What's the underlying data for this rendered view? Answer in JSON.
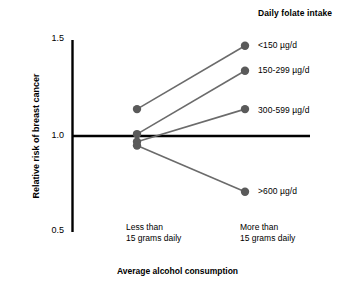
{
  "chart_data": {
    "type": "line",
    "title": "Daily folate intake",
    "xlabel": "Average alcohol consumption",
    "ylabel": "Relative risk of breast cancer",
    "x": [
      "Less than 15 grams daily",
      "More than 15 grams daily"
    ],
    "categories": [
      "Less than\n15 grams daily",
      "More than\n15 grams daily"
    ],
    "xtick_labels": [
      {
        "line1": "Less than",
        "line2": "15 grams daily"
      },
      {
        "line1": "More than",
        "line2": "15 grams daily"
      }
    ],
    "ylim": [
      0.5,
      1.5
    ],
    "ytick_labels": [
      "1.5",
      "1.0",
      "0.5"
    ],
    "ytick_values": [
      1.5,
      1.0,
      0.5
    ],
    "grid": false,
    "legend_position": "right-inline",
    "reference_line": {
      "value": 1.0,
      "label": "1.0",
      "color": "#000000"
    },
    "marker_color": "#5a5a5a",
    "line_color": "#6b6b6b",
    "series": [
      {
        "name": "<150 µg/d",
        "values": [
          1.14,
          1.47
        ]
      },
      {
        "name": "150-299 µg/d",
        "values": [
          1.01,
          1.34
        ]
      },
      {
        "name": "300-599 µg/d",
        "values": [
          0.97,
          1.14
        ]
      },
      {
        "name": ">600 µg/d",
        "values": [
          0.95,
          0.71
        ]
      }
    ]
  },
  "legend": {
    "title": "Daily folate intake",
    "items": [
      {
        "label": "<150 µg/d"
      },
      {
        "label": "150-299 µg/d"
      },
      {
        "label": "300-599 µg/d"
      },
      {
        "label": ">600 µg/d"
      }
    ]
  },
  "axes": {
    "y_title": "Relative risk of breast cancer",
    "x_title": "Average alcohol consumption",
    "y_ticks": [
      "1.5",
      "1.0",
      "0.5"
    ],
    "x_ticks": [
      {
        "line1": "Less than",
        "line2": "15 grams daily"
      },
      {
        "line1": "More than",
        "line2": "15 grams daily"
      }
    ]
  },
  "colors": {
    "marker": "#5a5a5a",
    "line": "#6b6b6b",
    "axis": "#000000",
    "background": "#ffffff",
    "text": "#000000"
  }
}
